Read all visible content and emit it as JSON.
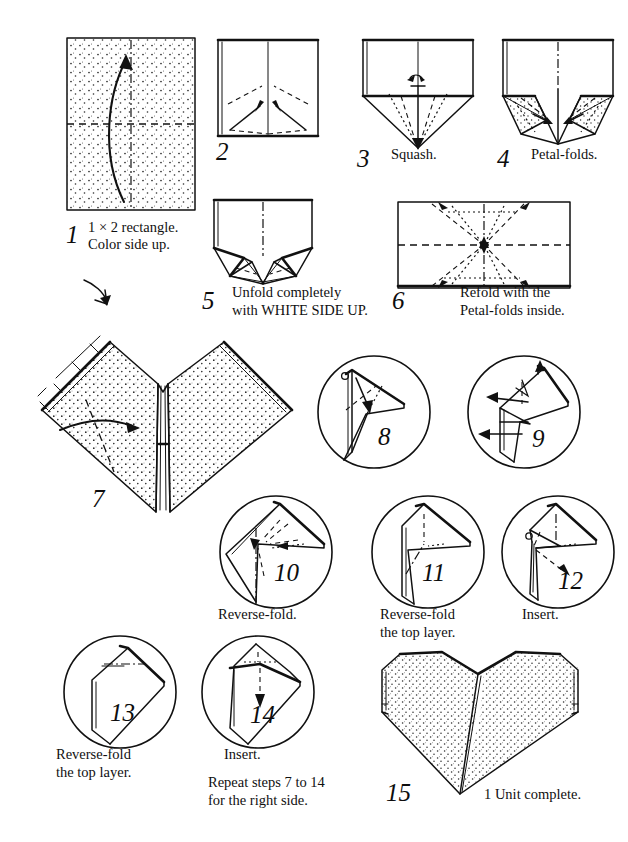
{
  "document": {
    "title": "Origami Heart — 1 Unit Folding Diagram",
    "background_color": "#ffffff",
    "ink_color": "#111111",
    "width": 628,
    "height": 842
  },
  "steps": [
    {
      "number": "1",
      "caption_line1": "1 × 2 rectangle.",
      "caption_line2": "Color side up.",
      "figure": "shaded-rectangle-with-curved-arrow",
      "shaded": true
    },
    {
      "number": "2",
      "caption_line1": "",
      "caption_line2": "",
      "figure": "square-with-two-diagonal-valley-arrows",
      "shaded": false
    },
    {
      "number": "3",
      "caption_line1": "Squash.",
      "caption_line2": "",
      "figure": "pointed-flap-with-squash-arrows",
      "shaded": false
    },
    {
      "number": "4",
      "caption_line1": "Petal-folds.",
      "caption_line2": "",
      "figure": "petal-fold-arrows-both-sides",
      "shaded": false
    },
    {
      "number": "5",
      "caption_line1": "Unfold completely",
      "caption_line2": "with WHITE SIDE UP.",
      "figure": "completed-petal-folds",
      "shaded": false
    },
    {
      "number": "6",
      "caption_line1": "Refold with the",
      "caption_line2": "Petal-folds inside.",
      "figure": "wide-rectangle-crease-pattern",
      "shaded": false
    },
    {
      "number": "7",
      "caption_line1": "",
      "caption_line2": "",
      "figure": "large-v-shape-shaded-with-fold-arrow",
      "shaded": true
    },
    {
      "number": "8",
      "caption_line1": "",
      "caption_line2": "",
      "figure": "circle-detail-fold-down-arrow",
      "shaded": false
    },
    {
      "number": "9",
      "caption_line1": "",
      "caption_line2": "",
      "figure": "circle-detail-two-left-arrows",
      "shaded": false
    },
    {
      "number": "10",
      "caption_line1": "Reverse-fold.",
      "caption_line2": "",
      "figure": "circle-detail-diamond-reverse-fold",
      "shaded": false
    },
    {
      "number": "11",
      "caption_line1": "Reverse-fold",
      "caption_line2": "the top layer.",
      "figure": "circle-detail-tall-shape-reverse-fold",
      "shaded": false
    },
    {
      "number": "12",
      "caption_line1": "Insert.",
      "caption_line2": "",
      "figure": "circle-detail-insert-arrow",
      "shaded": false
    },
    {
      "number": "13",
      "caption_line1": "Reverse-fold",
      "caption_line2": "the top layer.",
      "figure": "circle-detail-house-shape",
      "shaded": false
    },
    {
      "number": "14",
      "caption_line1": "Insert.",
      "caption_line2": "",
      "figure": "circle-detail-insert-tip-down",
      "shaded": false
    },
    {
      "number": "15",
      "caption_line1": "1 Unit complete.",
      "caption_line2": "",
      "figure": "finished-shaded-heart",
      "shaded": true
    }
  ],
  "notes": {
    "repeat_line1": "Repeat steps 7 to 14",
    "repeat_line2": "for the right side."
  }
}
